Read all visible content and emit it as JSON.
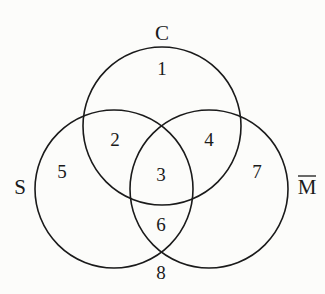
{
  "diagram": {
    "type": "venn-3",
    "sets": [
      {
        "id": "C",
        "label": "C",
        "cx": 162,
        "cy": 126,
        "r": 79,
        "label_x": 162,
        "label_y": 40
      },
      {
        "id": "S",
        "label": "S",
        "cx": 114,
        "cy": 189,
        "r": 79,
        "label_x": 20,
        "label_y": 194
      },
      {
        "id": "Mbar",
        "label": "M",
        "overline": true,
        "cx": 209,
        "cy": 189,
        "r": 79,
        "label_x": 307,
        "label_y": 194
      }
    ],
    "regions": [
      {
        "label": "1",
        "x": 162,
        "y": 75
      },
      {
        "label": "2",
        "x": 115,
        "y": 146
      },
      {
        "label": "3",
        "x": 161,
        "y": 181
      },
      {
        "label": "4",
        "x": 209,
        "y": 146
      },
      {
        "label": "5",
        "x": 62,
        "y": 178
      },
      {
        "label": "7",
        "x": 257,
        "y": 178
      },
      {
        "label": "6",
        "x": 161,
        "y": 231
      },
      {
        "label": "8",
        "x": 161,
        "y": 279
      }
    ],
    "stroke_color": "#1a1a1a",
    "background": "#fcfcfa"
  }
}
